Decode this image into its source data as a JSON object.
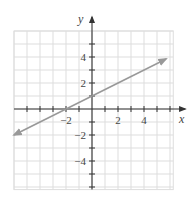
{
  "chart_data": {
    "type": "line",
    "title": "",
    "xlabel": "x",
    "ylabel": "y",
    "xlim": [
      -6,
      6.25
    ],
    "ylim": [
      -6.2,
      6
    ],
    "grid": true,
    "grid_step": 1,
    "x_tick_labels": [
      {
        "value": -2,
        "label": "−2"
      },
      {
        "value": 2,
        "label": "2"
      },
      {
        "value": 4,
        "label": "4"
      }
    ],
    "y_tick_labels": [
      {
        "value": 4,
        "label": "4"
      },
      {
        "value": 2,
        "label": "2"
      },
      {
        "value": -2,
        "label": "−2"
      },
      {
        "value": -4,
        "label": "−4"
      }
    ],
    "series": [
      {
        "name": "line",
        "equation": "y = x/2 + 1",
        "x": [
          -6,
          5.7
        ],
        "y": [
          -2,
          3.85
        ],
        "arrows_both_ends": true,
        "color": "#999999"
      }
    ]
  },
  "colors": {
    "axis": "#333333",
    "grid": "#dddddd",
    "line": "#999999"
  }
}
